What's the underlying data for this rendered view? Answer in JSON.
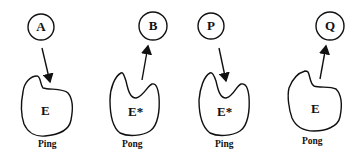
{
  "diagram": {
    "type": "ping-pong mechanism",
    "panels": [
      {
        "substrate": "A",
        "enzyme": "E",
        "caption": "Ping",
        "arrow": "substrate-to-enzyme"
      },
      {
        "substrate": "B",
        "enzyme": "E*",
        "caption": "Pong",
        "arrow": "enzyme-to-product"
      },
      {
        "substrate": "P",
        "enzyme": "E*",
        "caption": "Ping",
        "arrow": "substrate-to-enzyme"
      },
      {
        "substrate": "Q",
        "enzyme": "E",
        "caption": "Pong",
        "arrow": "enzyme-to-product"
      }
    ],
    "colors": {
      "stroke": "#111111",
      "background": "#ffffff"
    }
  }
}
